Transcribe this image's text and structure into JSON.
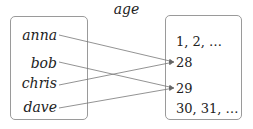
{
  "title": "age",
  "domain": {
    "items": [
      {
        "label": "anna",
        "maps_to": "28"
      },
      {
        "label": "bob",
        "maps_to": "29"
      },
      {
        "label": "chris",
        "maps_to": "28"
      },
      {
        "label": "dave",
        "maps_to": "29"
      }
    ]
  },
  "codomain": {
    "items": [
      {
        "label": "1, 2, …"
      },
      {
        "label": "28"
      },
      {
        "label": "29"
      },
      {
        "label": "30, 31, …"
      }
    ]
  },
  "colors": {
    "box_border": "#9a9a9a",
    "arrow": "#666666",
    "text": "#222222"
  }
}
